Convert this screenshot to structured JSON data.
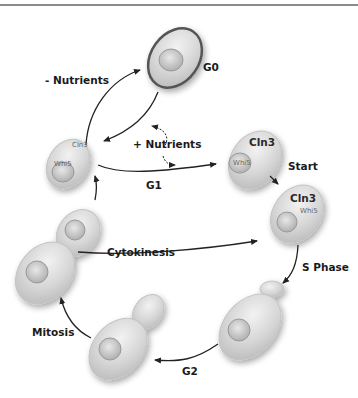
{
  "diagram": {
    "stages": {
      "g0": "G0",
      "g1": "G1",
      "start": "Start",
      "s_phase": "S Phase",
      "g2": "G2",
      "mitosis": "Mitosis",
      "cytokinesis": "Cytokinesis"
    },
    "transitions": {
      "minus_nutrients": "- Nutrients",
      "plus_nutrients": "+ Nutrients"
    },
    "proteins": {
      "g1_cell_cln3": "Cln3",
      "g1_cell_whi5": "Whi5",
      "start_cell_cln3": "Cln3",
      "start_cell_whi5": "Whi5",
      "s_cell_cln3": "Cln3",
      "s_cell_whi5": "Whi5"
    },
    "colors": {
      "cell_fill": "#d9d9d9",
      "cell_edge": "#b5b5b5",
      "g0_outline": "#555555",
      "arrow": "#222222",
      "text": "#1a1a1a"
    }
  }
}
